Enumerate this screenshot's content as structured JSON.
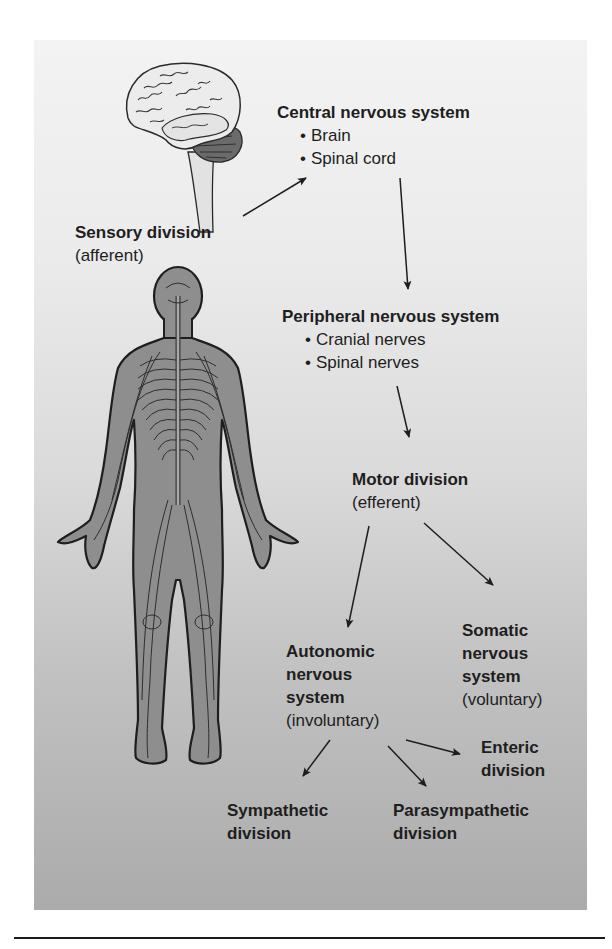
{
  "diagram": {
    "nodes": {
      "cns": {
        "title": "Central nervous system",
        "items": [
          "Brain",
          "Spinal cord"
        ]
      },
      "sensory": {
        "title": "Sensory division",
        "subtitle": "(afferent)"
      },
      "pns": {
        "title": "Peripheral nervous system",
        "items": [
          "Cranial nerves",
          "Spinal nerves"
        ]
      },
      "motor": {
        "title": "Motor division",
        "subtitle": "(efferent)"
      },
      "autonomic": {
        "title_lines": [
          "Autonomic",
          "nervous",
          "system"
        ],
        "subtitle": "(involuntary)"
      },
      "somatic": {
        "title_lines": [
          "Somatic",
          "nervous",
          "system"
        ],
        "subtitle": "(voluntary)"
      },
      "enteric": {
        "title_lines": [
          "Enteric",
          "division"
        ]
      },
      "sympathetic": {
        "title_lines": [
          "Sympathetic",
          "division"
        ]
      },
      "parasympathetic": {
        "title_lines": [
          "Parasympathetic",
          "division"
        ]
      }
    },
    "edges": [
      {
        "from": "sensory",
        "to": "cns"
      },
      {
        "from": "cns",
        "to": "pns"
      },
      {
        "from": "pns",
        "to": "motor"
      },
      {
        "from": "motor",
        "to": "autonomic"
      },
      {
        "from": "motor",
        "to": "somatic"
      },
      {
        "from": "autonomic",
        "to": "enteric"
      },
      {
        "from": "autonomic",
        "to": "sympathetic"
      },
      {
        "from": "autonomic",
        "to": "parasympathetic"
      }
    ],
    "illustrations": [
      "brain-and-brainstem",
      "human-body-nervous-system"
    ],
    "colors": {
      "panel_top": "#f3f3f3",
      "panel_bottom": "#ababab",
      "text": "#1e1e1e",
      "body_fill": "#8f8f8f",
      "brain_fill": "#e6e6e6"
    }
  }
}
